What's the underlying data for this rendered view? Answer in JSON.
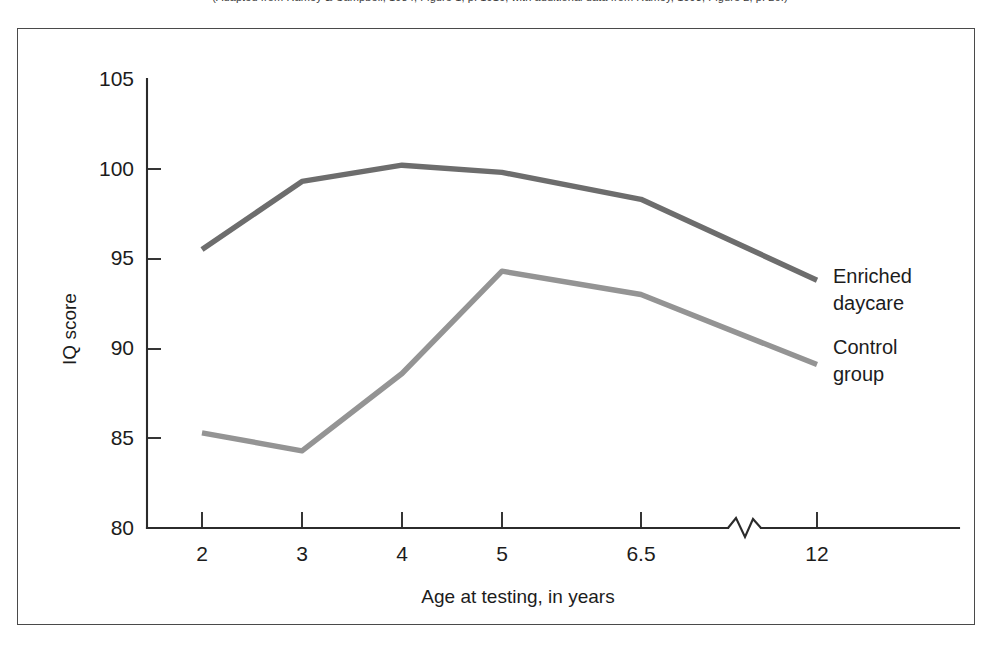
{
  "caption": {
    "text": "(Adapted from Ramey & Campbell, 1984, Figure 1, p. 1916, with additional data from Ramey, 1993, Figure 2, p. 26.)"
  },
  "chart_data": {
    "type": "line",
    "title": "",
    "xlabel": "Age at testing, in years",
    "ylabel": "IQ score",
    "x": [
      2,
      3,
      4,
      5,
      6.5,
      12
    ],
    "categories": [
      "2",
      "3",
      "4",
      "5",
      "6.5",
      "12"
    ],
    "xtick_labels": [
      "2",
      "3",
      "4",
      "5",
      "6.5",
      "12"
    ],
    "ytick_labels": [
      "80",
      "85",
      "90",
      "95",
      "100",
      "105"
    ],
    "ylim": [
      80,
      105
    ],
    "ytick_values": [
      80,
      85,
      90,
      95,
      100,
      105
    ],
    "grid": false,
    "legend_position": "right-inline",
    "axis_break": {
      "between": [
        "6.5",
        "12"
      ],
      "style": "zigzag"
    },
    "series": [
      {
        "name": "Enriched daycare",
        "label_line1": "Enriched",
        "label_line2": "daycare",
        "color": "#6d6d6d",
        "values": [
          95.5,
          99.3,
          100.2,
          99.8,
          98.3,
          93.8
        ]
      },
      {
        "name": "Control group",
        "label_line1": "Control",
        "label_line2": "group",
        "color": "#949494",
        "values": [
          85.3,
          84.3,
          88.6,
          94.3,
          93.0,
          89.1
        ]
      }
    ]
  },
  "colors": {
    "frame_border": "#4a4a4a",
    "axis": "#2b2b2b",
    "text": "#1c1c1c",
    "background": "#ffffff"
  }
}
